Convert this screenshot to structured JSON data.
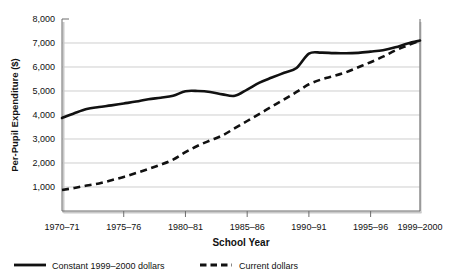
{
  "chart_data": {
    "type": "line",
    "title": "",
    "xlabel": "School Year",
    "ylabel": "Per-Pupil Expenditure ($)",
    "ylim": [
      0,
      8000
    ],
    "yticks": [
      1000,
      2000,
      3000,
      4000,
      5000,
      6000,
      7000,
      8000
    ],
    "ytick_labels": [
      "1,000",
      "2,000",
      "3,000",
      "4,000",
      "5,000",
      "6,000",
      "7,000",
      "8,000"
    ],
    "grid": true,
    "legend_position": "below-bottom-left",
    "categories": [
      "1970-71",
      "1971-72",
      "1972-73",
      "1973-74",
      "1974-75",
      "1975-76",
      "1976-77",
      "1977-78",
      "1978-79",
      "1979-80",
      "1980-81",
      "1981-82",
      "1982-83",
      "1983-84",
      "1984-85",
      "1985-86",
      "1986-87",
      "1987-88",
      "1988-89",
      "1989-90",
      "1990-91",
      "1991-92",
      "1992-93",
      "1993-94",
      "1994-95",
      "1995-96",
      "1996-97",
      "1997-98",
      "1998-99",
      "1999-2000"
    ],
    "xtick_labels": [
      "1970-71",
      "1975-76",
      "1980-81",
      "1985-86",
      "1990-91",
      "1995-96",
      "1999-2000"
    ],
    "xtick_categories": [
      "1970-71",
      "1975-76",
      "1980-81",
      "1985-86",
      "1990-91",
      "1995-96",
      "1999-2000"
    ],
    "series": [
      {
        "name": "Constant 1999-2000 dollars",
        "style": "solid",
        "color": "#111111",
        "values": [
          3875,
          4075,
          4250,
          4330,
          4400,
          4480,
          4560,
          4660,
          4720,
          4800,
          4990,
          5000,
          4960,
          4860,
          4800,
          5060,
          5350,
          5560,
          5760,
          5960,
          6560,
          6600,
          6580,
          6570,
          6590,
          6640,
          6700,
          6820,
          6980,
          7100
        ]
      },
      {
        "name": "Current dollars",
        "style": "dashed",
        "color": "#111111",
        "values": [
          875,
          960,
          1060,
          1150,
          1280,
          1420,
          1580,
          1750,
          1930,
          2140,
          2450,
          2720,
          2940,
          3150,
          3450,
          3750,
          4050,
          4350,
          4650,
          4960,
          5280,
          5480,
          5620,
          5780,
          5990,
          6200,
          6430,
          6690,
          6900,
          7100
        ]
      }
    ]
  },
  "legend": {
    "entries": [
      {
        "label": "Constant 1999-2000 dollars",
        "style": "solid"
      },
      {
        "label": "Current dollars",
        "style": "dashed"
      }
    ]
  },
  "axis_titles": {
    "x": "School Year",
    "y": "Per-Pupil Expenditure ($)"
  }
}
